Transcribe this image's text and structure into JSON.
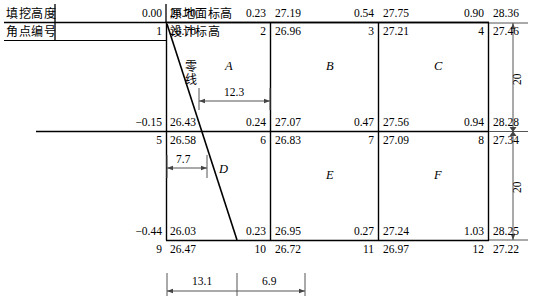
{
  "title_labels": {
    "row1_left": "填挖高度",
    "row2_left": "角点编号",
    "row1_right": "原地面标高",
    "row2_right": "设计标高"
  },
  "zero_line_label": "零线",
  "grid": {
    "rows": [
      {
        "row_index": 0,
        "points": [
          {
            "cut_fill": "0.00",
            "ground": "26.70",
            "corner": "1",
            "design": "26.70"
          },
          {
            "cut_fill": "0.23",
            "ground": "27.19",
            "corner": "2",
            "design": "26.96"
          },
          {
            "cut_fill": "0.54",
            "ground": "27.75",
            "corner": "3",
            "design": "27.21"
          },
          {
            "cut_fill": "0.90",
            "ground": "28.36",
            "corner": "4",
            "design": "27.46"
          }
        ]
      },
      {
        "row_index": 1,
        "points": [
          {
            "cut_fill": "−0.15",
            "ground": "26.43",
            "corner": "5",
            "design": "26.58"
          },
          {
            "cut_fill": "0.24",
            "ground": "27.07",
            "corner": "6",
            "design": "26.83"
          },
          {
            "cut_fill": "0.47",
            "ground": "27.56",
            "corner": "7",
            "design": "27.09"
          },
          {
            "cut_fill": "0.94",
            "ground": "28.28",
            "corner": "8",
            "design": "27.34"
          }
        ]
      },
      {
        "row_index": 2,
        "points": [
          {
            "cut_fill": "−0.44",
            "ground": "26.03",
            "corner": "9",
            "design": "26.47"
          },
          {
            "cut_fill": "0.23",
            "ground": "26.95",
            "corner": "10",
            "design": "26.72"
          },
          {
            "cut_fill": "0.27",
            "ground": "27.24",
            "corner": "11",
            "design": "26.97"
          },
          {
            "cut_fill": "1.03",
            "ground": "28.25",
            "corner": "12",
            "design": "27.22"
          }
        ]
      }
    ],
    "cells": [
      {
        "label": "A"
      },
      {
        "label": "B"
      },
      {
        "label": "C"
      },
      {
        "label": "D"
      },
      {
        "label": "E"
      },
      {
        "label": "F"
      }
    ]
  },
  "dimensions": {
    "top_cell_zero_offset": "12.3",
    "bottom_cell_zero_offset": "7.7",
    "bottom_span_left": "13.1",
    "bottom_span_right": "6.9",
    "right_span_upper": "20",
    "right_span_lower": "20"
  },
  "colors": {
    "ink": "#000000",
    "grid": "#1a1a1a",
    "dimension": "#555555"
  }
}
